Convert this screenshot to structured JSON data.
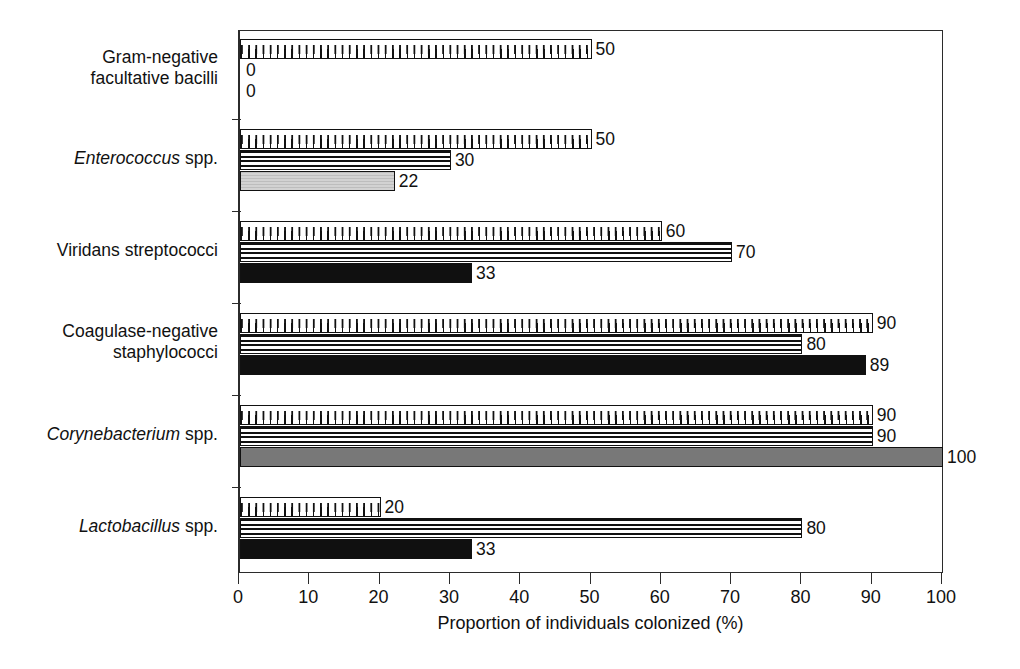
{
  "chart_data": {
    "type": "bar",
    "orientation": "horizontal",
    "title": "",
    "xlabel": "Proportion of individuals colonized (%)",
    "ylabel": "",
    "xlim": [
      0,
      100
    ],
    "xticks": [
      0,
      10,
      20,
      30,
      40,
      50,
      60,
      70,
      80,
      90,
      100
    ],
    "grid": false,
    "legend": "none",
    "categories": [
      "Gram-negative facultative bacilli",
      "Enterococcus spp.",
      "Viridans streptococci",
      "Coagulase-negative staphylococci",
      "Corynebacterium spp.",
      "Lactobacillus spp."
    ],
    "series": [
      {
        "name": "series-1",
        "pattern": "dotted",
        "values": [
          50,
          50,
          60,
          90,
          90,
          20
        ]
      },
      {
        "name": "series-2",
        "pattern": "striped",
        "values": [
          null,
          30,
          70,
          80,
          90,
          80
        ]
      },
      {
        "name": "series-3",
        "pattern": "solid",
        "values": [
          0,
          null,
          33,
          89,
          null,
          33
        ]
      },
      {
        "name": "series-4",
        "pattern": "gray",
        "values": [
          0,
          22,
          null,
          null,
          100,
          null
        ]
      }
    ]
  },
  "axis": {
    "title": "Proportion of individuals colonized (%)",
    "ticks": [
      "0",
      "10",
      "20",
      "30",
      "40",
      "50",
      "60",
      "70",
      "80",
      "90",
      "100"
    ]
  },
  "categories": [
    {
      "line1": "Gram-negative",
      "line2": "facultative bacilli",
      "genus": "",
      "rest": ""
    },
    {
      "line1": "",
      "line2": "",
      "genus": "Enterococcus",
      "rest": " spp."
    },
    {
      "line1": "Viridans streptococci",
      "line2": "",
      "genus": "",
      "rest": ""
    },
    {
      "line1": "Coagulase-negative",
      "line2": "staphylococci",
      "genus": "",
      "rest": ""
    },
    {
      "line1": "",
      "line2": "",
      "genus": "Corynebacterium",
      "rest": " spp."
    },
    {
      "line1": "",
      "line2": "",
      "genus": "Lactobacillus",
      "rest": " spp."
    }
  ],
  "bars": [
    {
      "group": 0,
      "pattern": "dotted",
      "value": 50,
      "label": "50"
    },
    {
      "group": 0,
      "pattern": "none",
      "value": 0,
      "label": "0"
    },
    {
      "group": 0,
      "pattern": "none",
      "value": 0,
      "label": "0"
    },
    {
      "group": 1,
      "pattern": "dotted",
      "value": 50,
      "label": "50"
    },
    {
      "group": 1,
      "pattern": "striped",
      "value": 30,
      "label": "30"
    },
    {
      "group": 1,
      "pattern": "lightgray",
      "value": 22,
      "label": "22"
    },
    {
      "group": 2,
      "pattern": "dotted",
      "value": 60,
      "label": "60"
    },
    {
      "group": 2,
      "pattern": "striped",
      "value": 70,
      "label": "70"
    },
    {
      "group": 2,
      "pattern": "black",
      "value": 33,
      "label": "33"
    },
    {
      "group": 3,
      "pattern": "dotted",
      "value": 90,
      "label": "90"
    },
    {
      "group": 3,
      "pattern": "striped",
      "value": 80,
      "label": "80"
    },
    {
      "group": 3,
      "pattern": "black",
      "value": 89,
      "label": "89"
    },
    {
      "group": 4,
      "pattern": "dotted",
      "value": 90,
      "label": "90"
    },
    {
      "group": 4,
      "pattern": "striped",
      "value": 90,
      "label": "90"
    },
    {
      "group": 4,
      "pattern": "gray",
      "value": 100,
      "label": "100"
    },
    {
      "group": 5,
      "pattern": "dotted",
      "value": 20,
      "label": "20"
    },
    {
      "group": 5,
      "pattern": "striped",
      "value": 80,
      "label": "80"
    },
    {
      "group": 5,
      "pattern": "black",
      "value": 33,
      "label": "33"
    }
  ],
  "colors": {
    "ink": "#111111",
    "axis": "#2b2b2b",
    "black_bar": "#101010",
    "gray_bar": "#787878",
    "light_gray_bar": "#d2d2d2",
    "background": "#ffffff"
  }
}
